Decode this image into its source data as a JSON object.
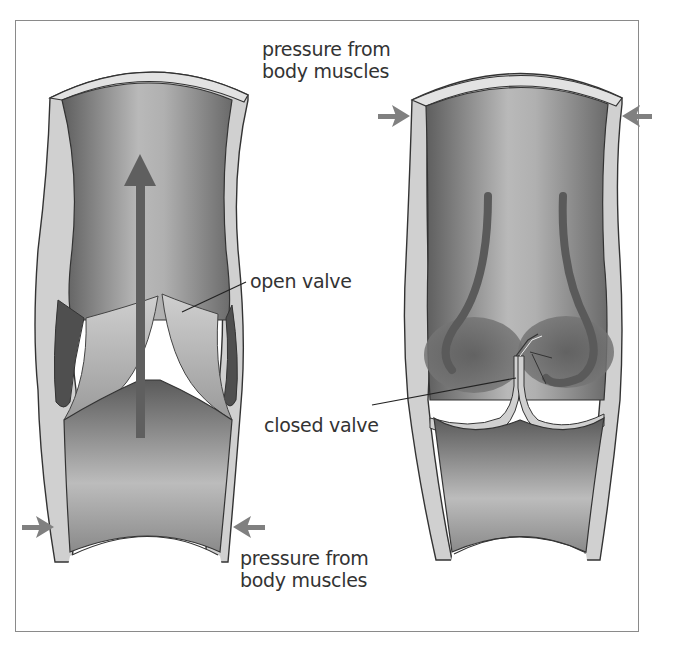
{
  "figure": {
    "colors": {
      "frame": "#8a8a8a",
      "wall": "#d0d0d0",
      "wall_outline": "#333333",
      "lumen_dark": "#6e6e6e",
      "lumen_light": "#bdbdbd",
      "flow_arrow": "#5f5f5f",
      "pressure_arrow": "#808080",
      "text": "#333333"
    }
  },
  "labels": {
    "pressure_top_line1": "pressure from",
    "pressure_top_line2": "body muscles",
    "open_valve": "open valve",
    "closed_valve": "closed valve",
    "pressure_bottom_line1": "pressure from",
    "pressure_bottom_line2": "body muscles"
  },
  "left_vein": {
    "state": "open valve",
    "flow_direction": "up",
    "pressure_arrows": "bottom (inward from both sides)"
  },
  "right_vein": {
    "state": "closed valve",
    "flow_direction": "backflow curling into valve pockets",
    "pressure_arrows": "top (inward from both sides)"
  }
}
